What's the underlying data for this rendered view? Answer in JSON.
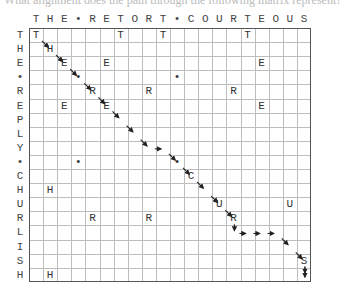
{
  "caption": "What alignment does the path through the following matrix represent?",
  "columns": [
    "T",
    "H",
    "E",
    "•",
    "R",
    "E",
    "T",
    "O",
    "R",
    "T",
    "•",
    "C",
    "O",
    "U",
    "R",
    "T",
    "E",
    "O",
    "U",
    "S"
  ],
  "rows": [
    "T",
    "H",
    "E",
    "•",
    "R",
    "E",
    "P",
    "L",
    "Y",
    "•",
    "C",
    "H",
    "U",
    "R",
    "L",
    "I",
    "S",
    "H"
  ],
  "column_sequence_label": "THE•RETORT•COURTEOUS",
  "row_sequence_label": "THE•REPLY•CHURLISH",
  "path": [
    [
      0,
      0
    ],
    [
      1,
      1
    ],
    [
      2,
      2
    ],
    [
      3,
      3
    ],
    [
      4,
      4
    ],
    [
      5,
      5
    ],
    [
      6,
      6
    ],
    [
      7,
      7
    ],
    [
      8,
      8
    ],
    [
      8,
      9
    ],
    [
      9,
      10
    ],
    [
      10,
      11
    ],
    [
      11,
      12
    ],
    [
      12,
      13
    ],
    [
      13,
      14
    ],
    [
      14,
      14
    ],
    [
      14,
      15
    ],
    [
      14,
      16
    ],
    [
      14,
      17
    ],
    [
      15,
      18
    ],
    [
      16,
      19
    ],
    [
      17,
      19
    ]
  ],
  "colors": {
    "grid_line": "#bdbdbd",
    "border": "#555555",
    "text": "#333333",
    "arrow": "#222222"
  }
}
